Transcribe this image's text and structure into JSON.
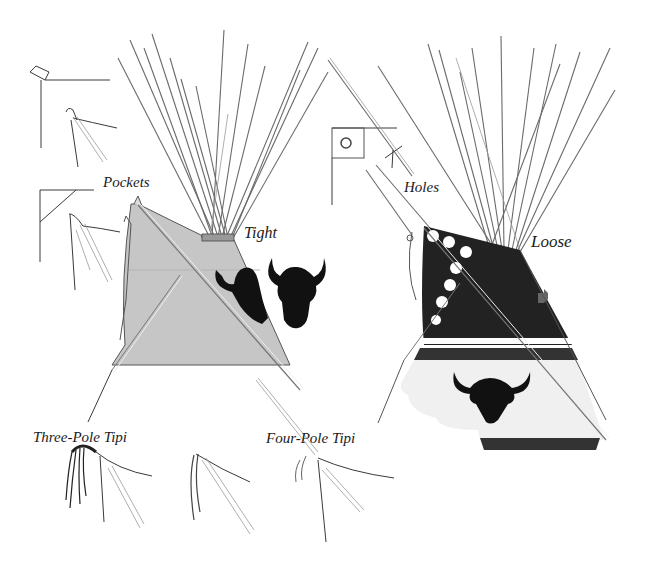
{
  "figure": {
    "type": "technical-illustration",
    "colors": {
      "background": "#ffffff",
      "tipi_left_cover": "#c8c8c8",
      "tipi_right_upper": "#222222",
      "tipi_right_lower": "#f0f0f0",
      "silhouette": "#111111",
      "line": "#555555"
    }
  },
  "labels": {
    "pockets": "Pockets",
    "tight": "Tight",
    "holes": "Holes",
    "loose": "Loose",
    "three_pole": "Three-Pole Tipi",
    "four_pole": "Four-Pole Tipi"
  },
  "panels": [
    {
      "id": "left-tipi",
      "label_key": "tight",
      "cover": "light gray",
      "decoration": "two buffalo-head silhouettes"
    },
    {
      "id": "right-tipi",
      "label_key": "loose",
      "cover": "dark upper band with white dots, light lower band",
      "decoration": "buffalo-head silhouette, cross motif"
    },
    {
      "id": "pocket-details",
      "label_key": "pockets",
      "count": 2
    },
    {
      "id": "hole-details",
      "label_key": "holes",
      "count": 2
    },
    {
      "id": "tie-details",
      "label_key": "three_pole",
      "count": 3
    }
  ]
}
